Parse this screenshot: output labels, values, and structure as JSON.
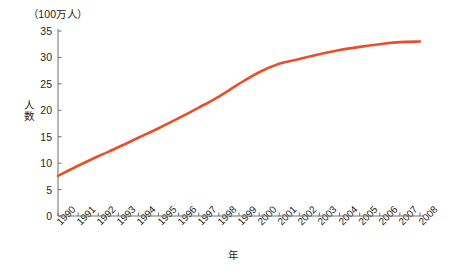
{
  "chart_data": {
    "type": "line",
    "title": "（100万人）",
    "xlabel": "年",
    "ylabel": "人数",
    "categories": [
      "1990",
      "1991",
      "1992",
      "1993",
      "1994",
      "1995",
      "1996",
      "1997",
      "1998",
      "1999",
      "2000",
      "2001",
      "2002",
      "2003",
      "2004",
      "2005",
      "2006",
      "2007",
      "2008"
    ],
    "values": [
      7.6,
      9.5,
      11.3,
      13.0,
      14.8,
      16.6,
      18.5,
      20.5,
      22.6,
      25.0,
      27.2,
      28.8,
      29.7,
      30.6,
      31.4,
      32.0,
      32.5,
      32.9,
      33.0
    ],
    "ylim": [
      0,
      35
    ],
    "yticks": [
      0,
      5,
      10,
      15,
      20,
      25,
      30,
      35
    ],
    "ytick_labels": [
      "0",
      "5",
      "10",
      "15",
      "20",
      "25",
      "30",
      "35"
    ],
    "grid": false,
    "legend": "none",
    "series_color": "#e8502a"
  },
  "axis": {
    "line_color": "#6d6e71",
    "tick_color": "#6d6e71"
  }
}
